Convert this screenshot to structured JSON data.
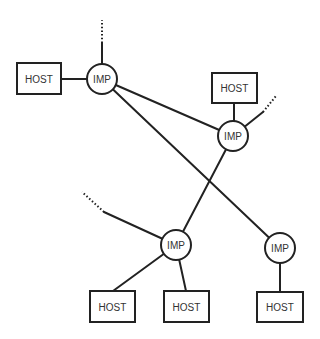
{
  "diagram": {
    "type": "network-topology",
    "colors": {
      "stroke": "#222222",
      "background": "#ffffff",
      "text": "#333333"
    },
    "imps": [
      {
        "id": "imp1",
        "label": "IMP",
        "cx": 102,
        "cy": 79,
        "r": 15
      },
      {
        "id": "imp2",
        "label": "IMP",
        "cx": 233,
        "cy": 136,
        "r": 15
      },
      {
        "id": "imp3",
        "label": "IMP",
        "cx": 176,
        "cy": 245,
        "r": 15
      },
      {
        "id": "imp4",
        "label": "IMP",
        "cx": 280,
        "cy": 248,
        "r": 15
      }
    ],
    "hosts": [
      {
        "id": "host1",
        "label": "HOST",
        "x": 17,
        "y": 63,
        "w": 44,
        "h": 31,
        "imp": "imp1"
      },
      {
        "id": "host2",
        "label": "HOST",
        "x": 212,
        "y": 73,
        "w": 45,
        "h": 30,
        "imp": "imp2"
      },
      {
        "id": "host3",
        "label": "HOST",
        "x": 90,
        "y": 291,
        "w": 45,
        "h": 31,
        "imp": "imp3"
      },
      {
        "id": "host4",
        "label": "HOST",
        "x": 164,
        "y": 291,
        "w": 45,
        "h": 31,
        "imp": "imp3"
      },
      {
        "id": "host5",
        "label": "HOST",
        "x": 257,
        "y": 292,
        "w": 46,
        "h": 30,
        "imp": "imp4"
      }
    ],
    "imp_links": [
      {
        "from": "imp1",
        "to": "imp2"
      },
      {
        "from": "imp1",
        "to": "imp4"
      },
      {
        "from": "imp2",
        "to": "imp3"
      }
    ],
    "external_links": [
      {
        "from": "imp1",
        "solid_end": [
          102,
          43
        ],
        "dotted_end": [
          102,
          20
        ]
      },
      {
        "from": "imp2",
        "solid_end": [
          263,
          112
        ],
        "dotted_end": [
          276,
          96
        ]
      },
      {
        "from": "imp3",
        "solid_end": [
          104,
          212
        ],
        "dotted_end": [
          82,
          192
        ]
      }
    ]
  }
}
